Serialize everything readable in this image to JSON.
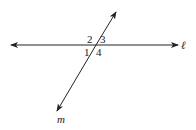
{
  "diagram": {
    "line_label": "ℓ",
    "transversal_label": "m",
    "angles": [
      "1",
      "2",
      "3",
      "4"
    ],
    "color": "#222222"
  }
}
